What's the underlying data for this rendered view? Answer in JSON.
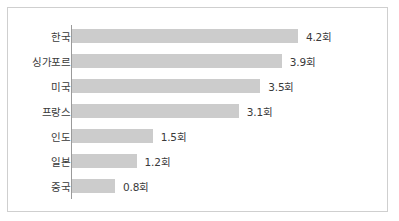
{
  "chart_data": {
    "type": "bar",
    "orientation": "horizontal",
    "title": "",
    "subtitle": "",
    "xlabel": "",
    "ylabel": "",
    "unit_suffix": "회",
    "grid": false,
    "legend": null,
    "legend_position": "none",
    "xlim": [
      0,
      4.2
    ],
    "categories": [
      "한국",
      "싱가포르",
      "미국",
      "프랑스",
      "인도",
      "일본",
      "중국"
    ],
    "values": [
      4.2,
      3.9,
      3.5,
      3.1,
      1.5,
      1.2,
      0.8
    ],
    "value_labels": [
      "4.2회",
      "3.9회",
      "3.5회",
      "3.1회",
      "1.5회",
      "1.2회",
      "0.8회"
    ],
    "bars": [
      {
        "category": "한국",
        "value": 4.2,
        "label": "4.2회"
      },
      {
        "category": "싱가포르",
        "value": 3.9,
        "label": "3.9회"
      },
      {
        "category": "미국",
        "value": 3.5,
        "label": "3.5회"
      },
      {
        "category": "프랑스",
        "value": 3.1,
        "label": "3.1회"
      },
      {
        "category": "인도",
        "value": 1.5,
        "label": "1.5회"
      },
      {
        "category": "일본",
        "value": 1.2,
        "label": "1.2회"
      },
      {
        "category": "중국",
        "value": 0.8,
        "label": "0.8회"
      }
    ]
  },
  "style": {
    "bar_color": "#cccccc",
    "axis_color": "#9a9a9a",
    "frame_color": "#cfcfcf",
    "text_color": "#3a3a3a",
    "background": "#ffffff"
  },
  "layout": {
    "px_per_unit": 53.8,
    "bar_height_px": 14,
    "row_pitch_px": 25,
    "first_row_top_px": 21,
    "axis_left_px": 64
  }
}
